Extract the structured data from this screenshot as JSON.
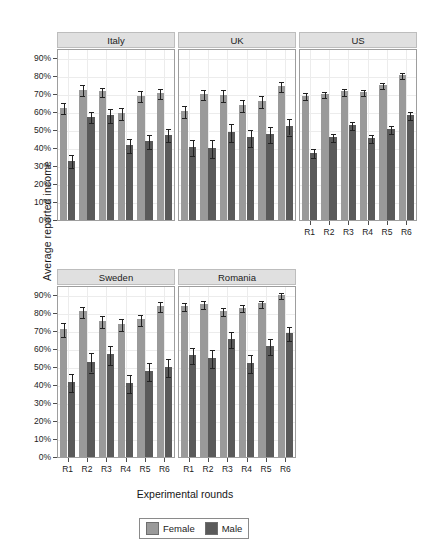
{
  "chart_data": {
    "type": "bar",
    "title": "",
    "xlabel": "Experimental rounds",
    "ylabel": "Average reported income",
    "ylim": [
      0,
      95
    ],
    "ytick_values": [
      0,
      10,
      20,
      30,
      40,
      50,
      60,
      70,
      80,
      90
    ],
    "ytick_labels": [
      "0%",
      "10%",
      "20%",
      "30%",
      "40%",
      "50%",
      "60%",
      "70%",
      "80%",
      "90%"
    ],
    "categories": [
      "R1",
      "R2",
      "R3",
      "R4",
      "R5",
      "R6"
    ],
    "grid": true,
    "legend_position": "bottom",
    "legend": [
      "Female",
      "Male"
    ],
    "colors": {
      "female": "#9a9a9a",
      "male": "#5a5a5a",
      "strip": "#e0e0e0",
      "error": "#222222"
    },
    "facets": [
      {
        "name": "Italy",
        "series": [
          {
            "name": "Female",
            "values": [
              62.5,
              72.5,
              71.5,
              59.5,
              69.0,
              70.5
            ],
            "err": [
              3.0,
              2.8,
              2.5,
              3.2,
              3.0,
              2.8
            ]
          },
          {
            "name": "Male",
            "values": [
              33.0,
              57.5,
              58.5,
              41.5,
              44.0,
              47.5
            ],
            "err": [
              3.5,
              3.2,
              4.0,
              3.8,
              4.0,
              3.8
            ]
          }
        ]
      },
      {
        "name": "UK",
        "series": [
          {
            "name": "Female",
            "values": [
              60.5,
              70.0,
              69.5,
              64.0,
              66.0,
              74.5
            ],
            "err": [
              3.5,
              3.0,
              3.2,
              3.2,
              3.2,
              3.0
            ]
          },
          {
            "name": "Male",
            "values": [
              40.5,
              40.0,
              49.0,
              46.0,
              48.0,
              52.0
            ],
            "err": [
              4.5,
              5.0,
              5.0,
              4.8,
              4.5,
              4.5
            ]
          }
        ]
      },
      {
        "name": "US",
        "series": [
          {
            "name": "Female",
            "values": [
              69.0,
              70.0,
              71.5,
              71.0,
              75.0,
              80.5
            ],
            "err": [
              2.0,
              1.8,
              1.8,
              1.8,
              1.8,
              1.8
            ]
          },
          {
            "name": "Male",
            "values": [
              37.5,
              46.0,
              53.0,
              45.5,
              50.5,
              58.5
            ],
            "err": [
              2.5,
              2.2,
              2.2,
              2.2,
              2.2,
              2.2
            ]
          }
        ]
      },
      {
        "name": "Sweden",
        "series": [
          {
            "name": "Female",
            "values": [
              71.0,
              81.0,
              75.5,
              74.0,
              76.5,
              84.0
            ],
            "err": [
              4.0,
              3.0,
              3.5,
              3.5,
              3.2,
              2.8
            ]
          },
          {
            "name": "Male",
            "values": [
              41.5,
              53.0,
              57.0,
              41.0,
              48.0,
              50.0
            ],
            "err": [
              5.0,
              5.5,
              5.5,
              5.0,
              5.0,
              5.0
            ]
          }
        ]
      },
      {
        "name": "Romania",
        "series": [
          {
            "name": "Female",
            "values": [
              84.0,
              85.0,
              81.0,
              83.0,
              85.5,
              90.0
            ],
            "err": [
              2.2,
              2.0,
              2.2,
              2.0,
              2.0,
              1.8
            ]
          },
          {
            "name": "Male",
            "values": [
              56.5,
              55.0,
              65.5,
              52.0,
              61.5,
              69.0
            ],
            "err": [
              4.5,
              5.0,
              4.5,
              5.0,
              4.5,
              4.0
            ]
          }
        ]
      }
    ]
  },
  "axis": {
    "ylabel": "Average reported income",
    "xlabel": "Experimental rounds"
  },
  "legend": {
    "female_label": "Female",
    "male_label": "Male"
  },
  "panels": {
    "italy": "Italy",
    "uk": "UK",
    "us": "US",
    "sweden": "Sweden",
    "romania": "Romania"
  }
}
